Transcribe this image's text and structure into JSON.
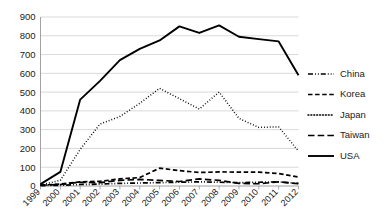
{
  "chart_data": {
    "type": "line",
    "title": "",
    "subtitle": "",
    "xlabel": "",
    "ylabel": "",
    "categories": [
      "1999",
      "2000",
      "2001",
      "2002",
      "2003",
      "2004",
      "2005",
      "2006",
      "2007",
      "2008",
      "2009",
      "2010",
      "2011",
      "2012"
    ],
    "ylim": [
      0,
      900
    ],
    "ytick_step": 100,
    "yticks": [
      "900",
      "800",
      "700",
      "600",
      "500",
      "400",
      "300",
      "200",
      "100",
      "0"
    ],
    "ytick_values": [
      900,
      800,
      700,
      600,
      500,
      400,
      300,
      200,
      100,
      0
    ],
    "grid": true,
    "grid_axis": "y",
    "legend_position": "right",
    "xtick_rotation": -45,
    "series": [
      {
        "name": "China",
        "line_style": "dash-dot-dot",
        "color": "#000000",
        "values": [
          2,
          4,
          8,
          10,
          14,
          16,
          18,
          20,
          22,
          20,
          18,
          20,
          22,
          14
        ]
      },
      {
        "name": "Korea",
        "line_style": "dashed",
        "color": "#000000",
        "values": [
          5,
          10,
          22,
          25,
          38,
          45,
          95,
          82,
          72,
          75,
          74,
          74,
          66,
          48
        ]
      },
      {
        "name": "Japan",
        "line_style": "dotted",
        "color": "#000000",
        "values": [
          5,
          30,
          195,
          330,
          370,
          440,
          520,
          465,
          410,
          500,
          360,
          312,
          315,
          185
        ]
      },
      {
        "name": "Taiwan",
        "line_style": "long-dash",
        "color": "#000000",
        "values": [
          4,
          8,
          20,
          18,
          30,
          35,
          30,
          24,
          38,
          30,
          14,
          12,
          22,
          12
        ]
      },
      {
        "name": "USA",
        "line_style": "solid",
        "color": "#000000",
        "values": [
          10,
          75,
          460,
          560,
          670,
          730,
          775,
          850,
          815,
          855,
          795,
          782,
          770,
          590
        ]
      }
    ]
  },
  "legend": {
    "items": [
      {
        "label": "China",
        "style": "dash-dot-dot"
      },
      {
        "label": "Korea",
        "style": "dashed"
      },
      {
        "label": "Japan",
        "style": "dotted"
      },
      {
        "label": "Taiwan",
        "style": "long-dash"
      },
      {
        "label": "USA",
        "style": "solid"
      }
    ]
  }
}
